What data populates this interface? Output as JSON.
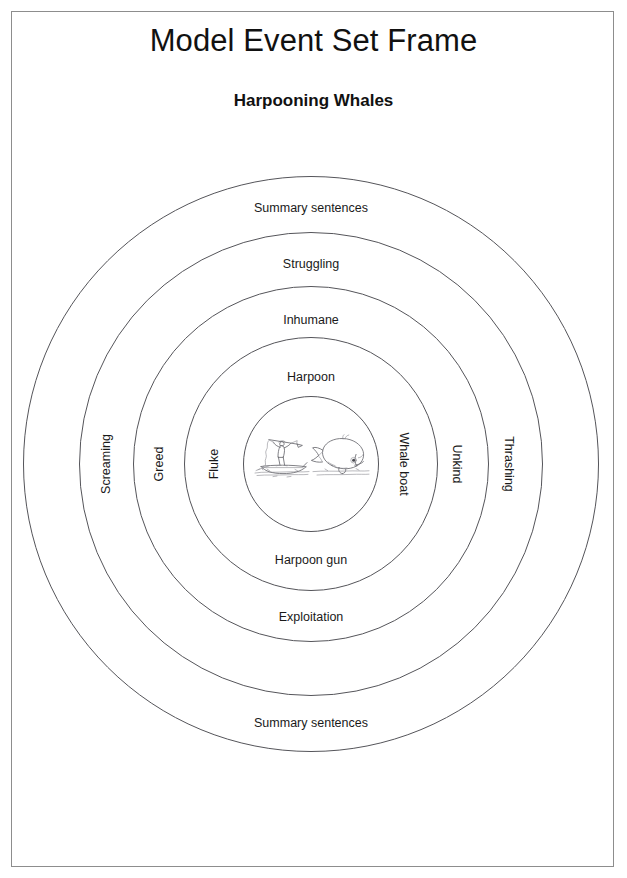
{
  "page": {
    "title": "Model Event Set Frame",
    "subtitle": "Harpooning Whales"
  },
  "diagram": {
    "type": "concentric-rings",
    "center_image_alt": "whaling-scene-line-drawing",
    "rings": [
      {
        "index": 1,
        "name": "core",
        "labels": {
          "top": "",
          "bottom": "",
          "left": "",
          "right": ""
        }
      },
      {
        "index": 2,
        "name": "ring-2",
        "labels": {
          "top": "Harpoon",
          "bottom": "Harpoon gun",
          "left": "Fluke",
          "right": "Whale boat"
        }
      },
      {
        "index": 3,
        "name": "ring-3",
        "labels": {
          "top": "Inhumane",
          "bottom": "Exploitation",
          "left": "Greed",
          "right": "Unkind"
        }
      },
      {
        "index": 4,
        "name": "ring-4",
        "labels": {
          "top": "Struggling",
          "bottom": "",
          "left": "Screaming",
          "right": "Thrashing"
        }
      },
      {
        "index": 5,
        "name": "ring-5",
        "labels": {
          "top": "Summary sentences",
          "bottom": "Summary sentences",
          "left": "",
          "right": ""
        }
      }
    ]
  },
  "colors": {
    "ring_stroke": "#55555a",
    "page_border": "#8d8d8d",
    "text": "#1a1a1a",
    "background": "#ffffff"
  }
}
